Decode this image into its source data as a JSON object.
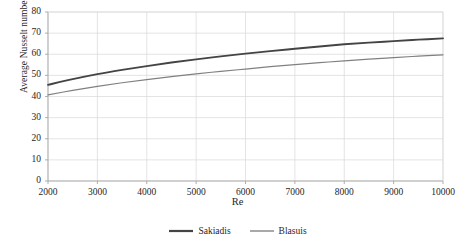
{
  "chart_data": {
    "type": "line",
    "title": "",
    "xlabel": "Re",
    "ylabel": "Average Nusselt number",
    "xlim": [
      2000,
      10000
    ],
    "ylim": [
      0,
      80
    ],
    "xticks": [
      2000,
      3000,
      4000,
      5000,
      6000,
      7000,
      8000,
      9000,
      10000
    ],
    "yticks": [
      0,
      10,
      20,
      30,
      40,
      50,
      60,
      70,
      80
    ],
    "xtick_labels": [
      "2000",
      "3000",
      "4000",
      "5000",
      "6000",
      "7000",
      "8000",
      "9000",
      "10000"
    ],
    "ytick_labels": [
      "0",
      "10",
      "20",
      "30",
      "40",
      "50",
      "60",
      "70",
      "80"
    ],
    "grid": true,
    "grid_color": "#d9d9d9",
    "axis_color": "#bfbfbf",
    "legend_position": "bottom-center",
    "x": [
      2000,
      2500,
      3000,
      3500,
      4000,
      4500,
      5000,
      5500,
      6000,
      6500,
      7000,
      7500,
      8000,
      8500,
      9000,
      9500,
      10000
    ],
    "series": [
      {
        "name": "Sakiadis",
        "color": "#444444",
        "width": 1.9,
        "values": [
          45.5,
          48.2,
          50.6,
          52.6,
          54.4,
          56.1,
          57.6,
          59.0,
          60.3,
          61.5,
          62.6,
          63.7,
          64.7,
          65.5,
          66.2,
          66.9,
          67.5
        ]
      },
      {
        "name": "Blasuis",
        "color": "#808080",
        "width": 1.2,
        "values": [
          40.8,
          42.9,
          44.8,
          46.5,
          48.0,
          49.4,
          50.7,
          51.9,
          53.0,
          54.1,
          55.1,
          56.0,
          56.9,
          57.7,
          58.4,
          59.1,
          59.7
        ]
      }
    ]
  },
  "legend": {
    "items": [
      {
        "label": "Sakiadis",
        "color": "#444444",
        "width": 2.2
      },
      {
        "label": "Blasuis",
        "color": "#8c8c8c",
        "width": 1.5
      }
    ]
  },
  "plot_box": {
    "left": 48,
    "top": 12,
    "right": 443,
    "bottom": 181
  }
}
